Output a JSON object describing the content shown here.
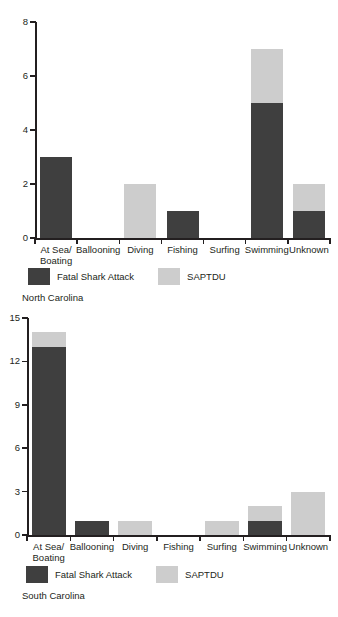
{
  "chart_data": [
    {
      "type": "bar",
      "title": "North Carolina",
      "subtitle": "",
      "xlabel": "",
      "ylabel": "",
      "stacked": true,
      "grid": false,
      "legend_position": "bottom-left",
      "ylim": [
        0,
        8
      ],
      "yticks": [
        0,
        2,
        4,
        6,
        8
      ],
      "ytick_labels": [
        "0",
        "2",
        "4",
        "6",
        "8"
      ],
      "categories": [
        "At Sea/ Boating",
        "Ballooning",
        "Diving",
        "Fishing",
        "Surfing",
        "Swimming",
        "Unknown"
      ],
      "category_lines": [
        [
          "At Sea/",
          "Boating"
        ],
        [
          "Ballooning"
        ],
        [
          "Diving"
        ],
        [
          "Fishing"
        ],
        [
          "Surfing"
        ],
        [
          "Swimming"
        ],
        [
          "Unknown"
        ]
      ],
      "series": [
        {
          "name": "Fatal Shark Attack",
          "color": "#3f3f3f",
          "values": [
            3,
            0,
            0,
            1,
            0,
            5,
            1
          ]
        },
        {
          "name": "SAPTDU",
          "color": "#cdcdcd",
          "values": [
            0,
            0,
            2,
            0,
            0,
            2,
            1
          ]
        }
      ],
      "totals": [
        3,
        0,
        2,
        1,
        0,
        7,
        2
      ]
    },
    {
      "type": "bar",
      "title": "South Carolina",
      "subtitle": "",
      "xlabel": "",
      "ylabel": "",
      "stacked": true,
      "grid": false,
      "legend_position": "bottom-left",
      "ylim": [
        0,
        15
      ],
      "yticks": [
        0,
        3,
        6,
        9,
        12,
        15
      ],
      "ytick_labels": [
        "0",
        "3",
        "6",
        "9",
        "12",
        "15"
      ],
      "categories": [
        "At Sea/ Boating",
        "Ballooning",
        "Diving",
        "Fishing",
        "Surfing",
        "Swimming",
        "Unknown"
      ],
      "category_lines": [
        [
          "At Sea/",
          "Boating"
        ],
        [
          "Ballooning"
        ],
        [
          "Diving"
        ],
        [
          "Fishing"
        ],
        [
          "Surfing"
        ],
        [
          "Swimming"
        ],
        [
          "Unknown"
        ]
      ],
      "series": [
        {
          "name": "Fatal Shark Attack",
          "color": "#3f3f3f",
          "values": [
            13,
            1,
            0,
            0,
            0,
            1,
            0
          ]
        },
        {
          "name": "SAPTDU",
          "color": "#cdcdcd",
          "values": [
            1,
            0,
            1,
            0,
            1,
            1,
            3
          ]
        }
      ],
      "totals": [
        14,
        1,
        1,
        0,
        1,
        2,
        3
      ]
    }
  ],
  "colors": {
    "fatal_shark_attack": "#3f3f3f",
    "saptdu": "#cdcdcd",
    "axis": "#231f20",
    "background": "#ffffff"
  },
  "legend": {
    "series_1_label": "Fatal Shark Attack",
    "series_2_label": "SAPTDU"
  },
  "captions": {
    "chart_1": "North Carolina",
    "chart_2": "South Carolina"
  }
}
